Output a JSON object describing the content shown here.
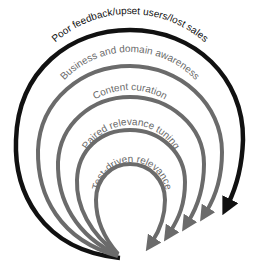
{
  "diagram": {
    "type": "concentric-arc-arrows",
    "colors": {
      "outer_arc": "#111111",
      "inner_arcs": "#6b6b6b",
      "outer_text": "#111111",
      "inner_text": "#6b6b6b",
      "background": "#ffffff"
    },
    "arcs": [
      {
        "label": "Poor feedback/upset users/lost sales"
      },
      {
        "label": "Business and domain awareness"
      },
      {
        "label": "Content curation"
      },
      {
        "label": "Paired relevance tuning"
      },
      {
        "label": "Test-driven relevance"
      }
    ]
  }
}
